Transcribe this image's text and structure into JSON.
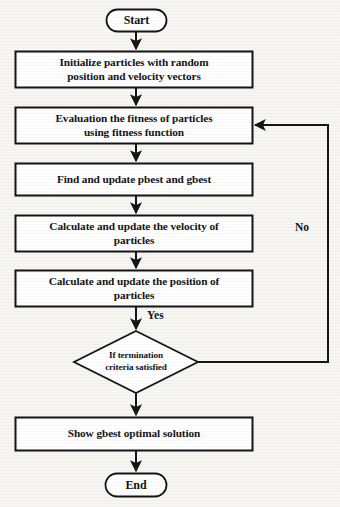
{
  "diagram": {
    "background_color": "#f7f6f3",
    "stroke_color": "#151515",
    "fill_color": "#ffffff",
    "nodes": {
      "start": {
        "label": "Start",
        "shape": "terminator"
      },
      "initialize": {
        "label": "Initialize particles with random\nposition and velocity vectors",
        "shape": "process"
      },
      "evaluate": {
        "label": "Evaluation the fitness of particles\nusing fitness function",
        "shape": "process"
      },
      "update_best": {
        "label": "Find and update pbest and gbest",
        "shape": "process"
      },
      "update_velocity": {
        "label": "Calculate and update the velocity of\nparticles",
        "shape": "process"
      },
      "update_position": {
        "label": "Calculate and update the position of\nparticles",
        "shape": "process"
      },
      "decision": {
        "label": "If termination\ncriteria satisfied",
        "shape": "decision"
      },
      "show_result": {
        "label": "Show gbest optimal solution",
        "shape": "process"
      },
      "end": {
        "label": "End",
        "shape": "terminator"
      }
    },
    "edge_labels": {
      "yes": "Yes",
      "no": "No"
    }
  }
}
